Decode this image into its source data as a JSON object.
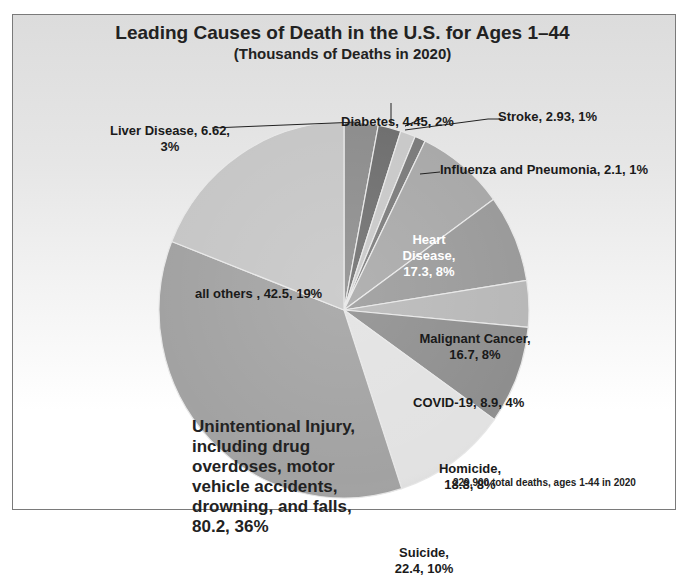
{
  "chart_data": {
    "type": "pie",
    "title": "Leading Causes of Death in the U.S. for Ages 1–44",
    "subtitle": "(Thousands of Deaths in 2020)",
    "footnote": "229,900 total deaths, ages 1-44 in 2020",
    "start_angle": "12 o'clock, clockwise",
    "slices": [
      {
        "name": "Liver Disease",
        "value": 6.62,
        "percent": "3%",
        "label": "Liver Disease, 6.62, 3%",
        "color": "#8c8c8c"
      },
      {
        "name": "Diabetes",
        "value": 4.45,
        "percent": "2%",
        "label": "Diabetes, 4.45, 2%",
        "color": "#6e6e6e"
      },
      {
        "name": "Stroke",
        "value": 2.93,
        "percent": "1%",
        "label": "Stroke, 2.93, 1%",
        "color": "#c8c8c8"
      },
      {
        "name": "Influenza and Pneumonia",
        "value": 2.1,
        "percent": "1%",
        "label": "Influenza and Pneumonia, 2.1, 1%",
        "color": "#7a7a7a"
      },
      {
        "name": "Heart Disease",
        "value": 17.3,
        "percent": "8%",
        "label": "Heart Disease, 17.3, 8%",
        "color": "#a8a8a8"
      },
      {
        "name": "Malignant Cancer",
        "value": 16.7,
        "percent": "8%",
        "label": "Malignant Cancer, 16.7, 8%",
        "color": "#9a9a9a"
      },
      {
        "name": "COVID-19",
        "value": 8.9,
        "percent": "4%",
        "label": "COVID-19, 8.9, 4%",
        "color": "#b8b8b8"
      },
      {
        "name": "Homicide",
        "value": 18.8,
        "percent": "8%",
        "label": "Homicide, 18.8, 8%",
        "color": "#8e8e8e"
      },
      {
        "name": "Suicide",
        "value": 22.4,
        "percent": "10%",
        "label": "Suicide, 22.4, 10%",
        "color": "#e2e2e2"
      },
      {
        "name": "Unintentional Injury, including drug overdoses, motor vehicle accidents, drowning, and falls",
        "value": 80.2,
        "percent": "36%",
        "label": "Unintentional Injury, including drug overdoses, motor vehicle accidents, drowning, and falls, 80.2, 36%",
        "color": "#a2a2a2"
      },
      {
        "name": "all others",
        "value": 42.5,
        "percent": "19%",
        "label": "all others , 42.5, 19%",
        "color": "#c6c6c6"
      }
    ],
    "total": "229,900 total deaths",
    "legend": "none (data labels on slices)"
  },
  "labels": {
    "liver_l1": "Liver Disease, 6.62,",
    "liver_l2": "3%",
    "diabetes": "Diabetes, 4.45, 2%",
    "stroke": "Stroke, 2.93, 1%",
    "influenza": "Influenza and Pneumonia, 2.1, 1%",
    "heart_l1": "Heart",
    "heart_l2": "Disease,",
    "heart_l3": "17.3, 8%",
    "cancer_l1": "Malignant Cancer,",
    "cancer_l2": "16.7, 8%",
    "covid": "COVID-19, 8.9, 4%",
    "homicide_l1": "Homicide,",
    "homicide_l2": "18.8, 8%",
    "suicide_l1": "Suicide,",
    "suicide_l2": "22.4, 10%",
    "unint_l1": "Unintentional Injury,",
    "unint_l2": "including drug",
    "unint_l3": "overdoses, motor",
    "unint_l4": "vehicle accidents,",
    "unint_l5": "drowning, and falls,",
    "unint_l6": "80.2, 36%",
    "others": "all others , 42.5, 19%"
  }
}
